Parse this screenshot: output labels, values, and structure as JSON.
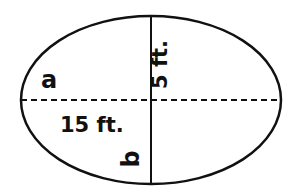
{
  "diagram": {
    "shape": "ellipse",
    "stroke_color": "#111111",
    "background": "#ffffff",
    "labels": {
      "semi_major_axis_var": "a",
      "semi_major_axis_len": "15 ft.",
      "semi_minor_axis_var": "b",
      "semi_minor_axis_len": "5 ft."
    },
    "axes": {
      "horizontal": "dashed",
      "vertical": "solid"
    }
  }
}
